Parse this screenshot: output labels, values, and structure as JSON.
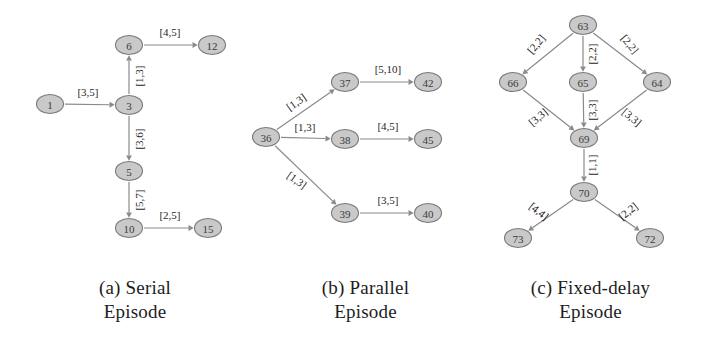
{
  "figure": {
    "background": "#ffffff",
    "node_fill": "#c9c9c9",
    "node_stroke": "#7a7a7a",
    "edge_color": "#8a8a8a",
    "text_color": "#262626"
  },
  "chart_data": {
    "type": "diagram",
    "panels": [
      {
        "id": "a",
        "caption": "(a) Serial\nEpisode",
        "nodes": [
          {
            "id": "n1",
            "label": "1",
            "x": 50,
            "y": 104
          },
          {
            "id": "n6",
            "label": "6",
            "x": 129,
            "y": 45
          },
          {
            "id": "n12",
            "label": "12",
            "x": 212,
            "y": 45
          },
          {
            "id": "n3",
            "label": "3",
            "x": 129,
            "y": 105
          },
          {
            "id": "n5",
            "label": "5",
            "x": 129,
            "y": 171
          },
          {
            "id": "n10",
            "label": "10",
            "x": 129,
            "y": 228
          },
          {
            "id": "n15",
            "label": "15",
            "x": 208,
            "y": 228
          }
        ],
        "edges": [
          {
            "from": "n1",
            "to": "n3",
            "label": "[3,5]",
            "label_rotation": 0,
            "label_x": 88,
            "label_y": 92
          },
          {
            "from": "n3",
            "to": "n6",
            "label": "[1,3]",
            "label_rotation": -90,
            "label_x": 139,
            "label_y": 76
          },
          {
            "from": "n6",
            "to": "n12",
            "label": "[4,5]",
            "label_rotation": 0,
            "label_x": 170,
            "label_y": 32
          },
          {
            "from": "n3",
            "to": "n5",
            "label": "[3,6]",
            "label_rotation": -90,
            "label_x": 139,
            "label_y": 139
          },
          {
            "from": "n5",
            "to": "n10",
            "label": "[5,7]",
            "label_rotation": -90,
            "label_x": 139,
            "label_y": 200
          },
          {
            "from": "n10",
            "to": "n15",
            "label": "[2,5]",
            "label_rotation": 0,
            "label_x": 170,
            "label_y": 215
          }
        ]
      },
      {
        "id": "b",
        "caption": "(b) Parallel\nEpisode",
        "nodes": [
          {
            "id": "n36",
            "label": "36",
            "x": 266,
            "y": 137
          },
          {
            "id": "n37",
            "label": "37",
            "x": 345,
            "y": 82
          },
          {
            "id": "n42",
            "label": "42",
            "x": 428,
            "y": 82
          },
          {
            "id": "n38",
            "label": "38",
            "x": 345,
            "y": 139
          },
          {
            "id": "n45",
            "label": "45",
            "x": 428,
            "y": 139
          },
          {
            "id": "n39",
            "label": "39",
            "x": 345,
            "y": 213
          },
          {
            "id": "n40",
            "label": "40",
            "x": 428,
            "y": 213
          }
        ],
        "edges": [
          {
            "from": "n36",
            "to": "n37",
            "label": "[1,3]",
            "label_rotation": -35,
            "label_x": 296,
            "label_y": 102
          },
          {
            "from": "n37",
            "to": "n42",
            "label": "[5,10]",
            "label_rotation": 0,
            "label_x": 388,
            "label_y": 69
          },
          {
            "from": "n36",
            "to": "n38",
            "label": "[1,3]",
            "label_rotation": 0,
            "label_x": 305,
            "label_y": 127
          },
          {
            "from": "n38",
            "to": "n45",
            "label": "[4,5]",
            "label_rotation": 0,
            "label_x": 388,
            "label_y": 126
          },
          {
            "from": "n36",
            "to": "n39",
            "label": "[1,3]",
            "label_rotation": 35,
            "label_x": 297,
            "label_y": 180
          },
          {
            "from": "n39",
            "to": "n40",
            "label": "[3,5]",
            "label_rotation": 0,
            "label_x": 388,
            "label_y": 200
          }
        ]
      },
      {
        "id": "c",
        "caption": "(c) Fixed-delay\nEpisode",
        "nodes": [
          {
            "id": "n63",
            "label": "63",
            "x": 583,
            "y": 25
          },
          {
            "id": "n66",
            "label": "66",
            "x": 513,
            "y": 82
          },
          {
            "id": "n65",
            "label": "65",
            "x": 583,
            "y": 82
          },
          {
            "id": "n64",
            "label": "64",
            "x": 657,
            "y": 82
          },
          {
            "id": "n69",
            "label": "69",
            "x": 584,
            "y": 138
          },
          {
            "id": "n70",
            "label": "70",
            "x": 584,
            "y": 192
          },
          {
            "id": "n73",
            "label": "73",
            "x": 518,
            "y": 238
          },
          {
            "id": "n72",
            "label": "72",
            "x": 650,
            "y": 238
          }
        ],
        "edges": [
          {
            "from": "n63",
            "to": "n66",
            "label": "[2,2]",
            "label_rotation": -50,
            "label_x": 536,
            "label_y": 44
          },
          {
            "from": "n63",
            "to": "n65",
            "label": "[2,2]",
            "label_rotation": -90,
            "label_x": 592,
            "label_y": 54
          },
          {
            "from": "n63",
            "to": "n64",
            "label": "[2,2]",
            "label_rotation": 50,
            "label_x": 630,
            "label_y": 44
          },
          {
            "from": "n66",
            "to": "n69",
            "label": "[3,3]",
            "label_rotation": -40,
            "label_x": 538,
            "label_y": 117
          },
          {
            "from": "n65",
            "to": "n69",
            "label": "[3,3]",
            "label_rotation": -90,
            "label_x": 592,
            "label_y": 110
          },
          {
            "from": "n64",
            "to": "n69",
            "label": "[3,3]",
            "label_rotation": 40,
            "label_x": 632,
            "label_y": 117
          },
          {
            "from": "n69",
            "to": "n70",
            "label": "[1,1]",
            "label_rotation": -90,
            "label_x": 592,
            "label_y": 165
          },
          {
            "from": "n70",
            "to": "n73",
            "label": "[4,4]",
            "label_rotation": 38,
            "label_x": 539,
            "label_y": 211
          },
          {
            "from": "n70",
            "to": "n72",
            "label": "[2,2]",
            "label_rotation": -38,
            "label_x": 628,
            "label_y": 211
          }
        ]
      }
    ]
  }
}
